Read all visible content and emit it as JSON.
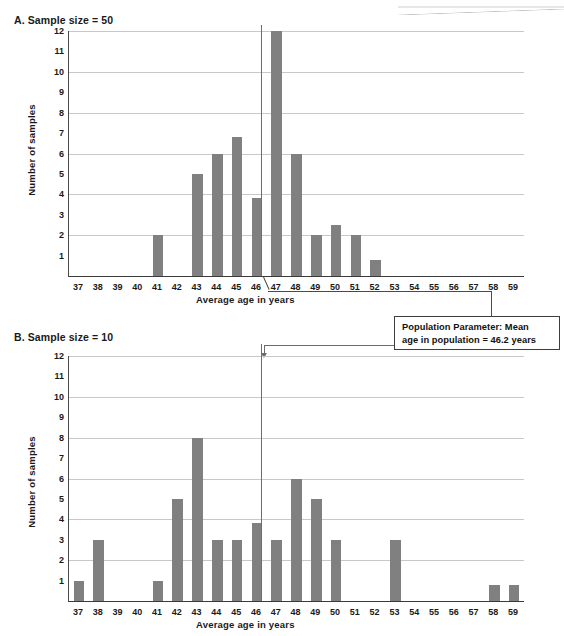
{
  "figure": {
    "bar_color": "#808080",
    "grid_color": "#c8c8c8",
    "axis_color": "#3a3a3a"
  },
  "callout": {
    "name": "population-parameter-callout",
    "line1": "Population Parameter: Mean",
    "line2": "age in population = 46.2 years",
    "full_text": "Population Parameter: Mean age in population = 46.2 years",
    "points_to": 46.2
  },
  "chart_data": [
    {
      "id": "panel-a",
      "type": "bar",
      "title": "A. Sample size = 50",
      "xlabel": "Average age in years",
      "ylabel": "Number of samples",
      "categories": [
        37,
        38,
        39,
        40,
        41,
        42,
        43,
        44,
        45,
        46,
        47,
        48,
        49,
        50,
        51,
        52,
        53,
        54,
        55,
        56,
        57,
        58,
        59
      ],
      "values": [
        0,
        0,
        0,
        0,
        2,
        0,
        5,
        6,
        6.8,
        3.8,
        12,
        6,
        2,
        2.5,
        2,
        0.8,
        0,
        0,
        0,
        0,
        0,
        0,
        0
      ],
      "ylim": [
        0,
        12
      ],
      "yticks": [
        1,
        2,
        3,
        4,
        5,
        6,
        7,
        8,
        9,
        10,
        11,
        12
      ],
      "gridlines": [
        2,
        4,
        6,
        8,
        10,
        12
      ],
      "grid": true,
      "legend": "none",
      "reference_line": {
        "x": 46.2,
        "label": "Population mean = 46.2 years"
      }
    },
    {
      "id": "panel-b",
      "type": "bar",
      "title": "B. Sample size = 10",
      "xlabel": "Average age in years",
      "ylabel": "Number of samples",
      "categories": [
        37,
        38,
        39,
        40,
        41,
        42,
        43,
        44,
        45,
        46,
        47,
        48,
        49,
        50,
        51,
        52,
        53,
        54,
        55,
        56,
        57,
        58,
        59
      ],
      "values": [
        1,
        3,
        0,
        0,
        1,
        5,
        8,
        3,
        3,
        3.8,
        3,
        6,
        5,
        3,
        0,
        0,
        3,
        0,
        0,
        0,
        0,
        0.8,
        0.8
      ],
      "ylim": [
        0,
        12
      ],
      "yticks": [
        1,
        2,
        3,
        4,
        5,
        6,
        7,
        8,
        9,
        10,
        11,
        12
      ],
      "gridlines": [
        2,
        4,
        6,
        8,
        10,
        12
      ],
      "grid": true,
      "legend": "none",
      "reference_line": {
        "x": 46.2,
        "label": "Population mean = 46.2 years"
      }
    }
  ]
}
